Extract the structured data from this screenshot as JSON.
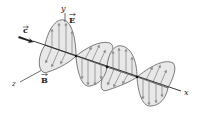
{
  "figure": {
    "labels": {
      "y_axis": "y",
      "z_axis": "z",
      "x_axis": "x",
      "electric_field": "E",
      "magnetic_field": "B",
      "velocity": "c"
    },
    "colors": {
      "lobe_fill": "#e8e8e8",
      "lobe_stroke": "#5a5a5a",
      "field_arrow": "#8a8a8a",
      "axis": "#222222",
      "velocity_arrow": "#222222"
    },
    "wave": {
      "nodes": [
        [
          45,
          45
        ],
        [
          76,
          56
        ],
        [
          107,
          67
        ],
        [
          137,
          77
        ],
        [
          168,
          88
        ]
      ],
      "e_lobe_peaks": [
        [
          63,
          20
        ],
        [
          88,
          86
        ],
        [
          122,
          46
        ],
        [
          149,
          106
        ]
      ],
      "b_lobe_peaks": [
        [
          42,
          72
        ],
        [
          110,
          43
        ],
        [
          104,
          91
        ],
        [
          172,
          63
        ]
      ]
    }
  }
}
